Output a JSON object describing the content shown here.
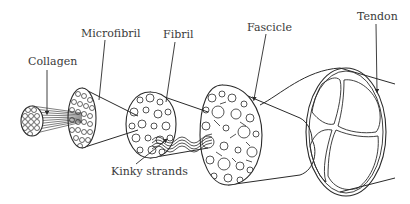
{
  "diagram": {
    "labels": {
      "collagen": "Collagen",
      "microfibril": "Microfibril",
      "fibril": "Fibril",
      "fascicle": "Fascicle",
      "tendon": "Tendon",
      "kinky_strands": "Kinky strands"
    },
    "stroke_color": "#2a2a2a",
    "background": "#ffffff"
  }
}
